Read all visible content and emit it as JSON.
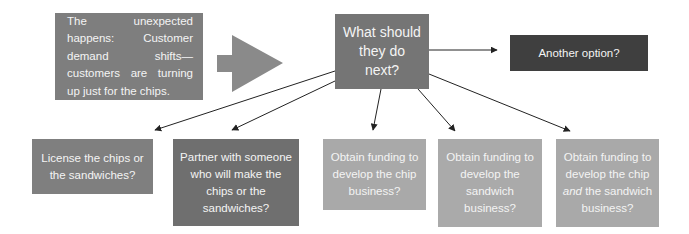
{
  "diagram": {
    "start_box": {
      "text": "The unexpected happens: Customer demand shifts—customers are turning up just for the chips."
    },
    "center_box": {
      "text": "What should they do next?"
    },
    "options": [
      {
        "id": "another",
        "text": "Another option?"
      },
      {
        "id": "license",
        "text": "License the chips or the sandwiches?"
      },
      {
        "id": "partner",
        "text": "Partner with someone who will make the chips or the sandwiches?"
      },
      {
        "id": "fund-chip",
        "text": "Obtain funding to develop the chip business?"
      },
      {
        "id": "fund-sandwich",
        "text": "Obtain funding to develop the sandwich business?"
      },
      {
        "id": "fund-both",
        "prefix_italic": "and",
        "text_before": "Obtain funding to develop the chip",
        "text_after": "the sandwich business?"
      }
    ],
    "colors": {
      "start": "#7e7e7e",
      "center": "#757575",
      "another": "#3f3f3f",
      "license": "#7f7f7f",
      "partner": "#6f6f6f",
      "funding": "#a9a9a9",
      "arrow_shape": "#8a8a8a",
      "line": "#222222"
    }
  }
}
